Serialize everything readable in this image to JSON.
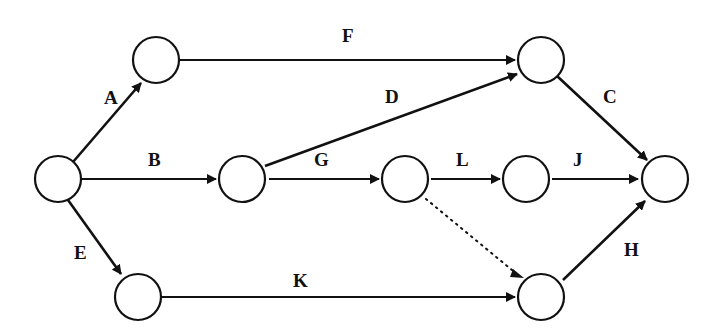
{
  "diagram": {
    "type": "activity-on-arrow network",
    "nodes": [
      {
        "id": "n1",
        "x": 58,
        "y": 179
      },
      {
        "id": "n2",
        "x": 156,
        "y": 60
      },
      {
        "id": "n3",
        "x": 242,
        "y": 179
      },
      {
        "id": "n4",
        "x": 541,
        "y": 60
      },
      {
        "id": "n5",
        "x": 405,
        "y": 179
      },
      {
        "id": "n6",
        "x": 526,
        "y": 179
      },
      {
        "id": "n7",
        "x": 665,
        "y": 179
      },
      {
        "id": "n8",
        "x": 138,
        "y": 297
      },
      {
        "id": "n9",
        "x": 541,
        "y": 297
      }
    ],
    "edges": [
      {
        "label": "A",
        "from": "n1",
        "to": "n2"
      },
      {
        "label": "B",
        "from": "n1",
        "to": "n3"
      },
      {
        "label": "E",
        "from": "n1",
        "to": "n8"
      },
      {
        "label": "F",
        "from": "n2",
        "to": "n4"
      },
      {
        "label": "D",
        "from": "n3",
        "to": "n4"
      },
      {
        "label": "G",
        "from": "n3",
        "to": "n5"
      },
      {
        "label": "L",
        "from": "n5",
        "to": "n6"
      },
      {
        "label": "",
        "from": "n5",
        "to": "n9",
        "style": "dotted"
      },
      {
        "label": "J",
        "from": "n6",
        "to": "n7"
      },
      {
        "label": "C",
        "from": "n4",
        "to": "n7"
      },
      {
        "label": "K",
        "from": "n8",
        "to": "n9"
      },
      {
        "label": "H",
        "from": "n9",
        "to": "n7"
      }
    ]
  },
  "labels": {
    "A": "A",
    "B": "B",
    "C": "C",
    "D": "D",
    "E": "E",
    "F": "F",
    "G": "G",
    "H": "H",
    "J": "J",
    "K": "K",
    "L": "L"
  }
}
